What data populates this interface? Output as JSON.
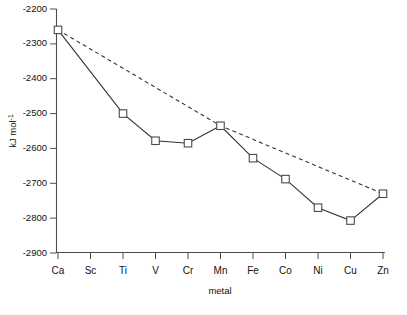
{
  "chart_data": {
    "type": "line",
    "title": "",
    "xlabel": "metal",
    "ylabel": "kJ mol-1",
    "ylabel_base": "kJ mol",
    "ylabel_exponent": "-1",
    "categories": [
      "Ca",
      "Sc",
      "Ti",
      "V",
      "Cr",
      "Mn",
      "Fe",
      "Co",
      "Ni",
      "Cu",
      "Zn"
    ],
    "ylim": [
      -2900,
      -2200
    ],
    "yticks": [
      -2200,
      -2300,
      -2400,
      -2500,
      -2600,
      -2700,
      -2800,
      -2900
    ],
    "ytick_labels": [
      "-2200",
      "-2300",
      "-2400",
      "-2500",
      "-2600",
      "-2700",
      "-2800",
      "-2900"
    ],
    "grid": false,
    "legend": "none",
    "series": [
      {
        "name": "measured",
        "style": "solid",
        "marker": "open-square",
        "x": [
          "Ca",
          "Ti",
          "V",
          "Cr",
          "Mn",
          "Fe",
          "Co",
          "Ni",
          "Cu",
          "Zn"
        ],
        "values": [
          -2260,
          -2500,
          -2578,
          -2585,
          -2535,
          -2628,
          -2688,
          -2770,
          -2807,
          -2730
        ]
      },
      {
        "name": "trend",
        "style": "dashed",
        "marker": "none",
        "x": [
          "Ca",
          "Mn",
          "Zn"
        ],
        "values": [
          -2260,
          -2535,
          -2730
        ]
      }
    ],
    "missing_points": [
      "Sc"
    ]
  },
  "axes": {
    "x_axis_name": "metal-axis",
    "y_axis_name": "energy-axis"
  }
}
